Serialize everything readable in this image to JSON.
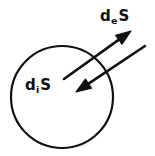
{
  "figure": {
    "background_color": "#ffffff",
    "stroke_color": "#111111",
    "labels": {
      "external": {
        "base": "d",
        "sub": "e",
        "symbol": "S",
        "full": "deS"
      },
      "internal": {
        "base": "d",
        "sub": "i",
        "symbol": "S",
        "full": "diS"
      }
    },
    "shapes": {
      "circle": {
        "cx": 62,
        "cy": 97,
        "r": 51,
        "stroke_width": 2.2,
        "fill": "none"
      },
      "arrow_outward": {
        "name": "external-entropy-flow-arrow",
        "x1": 64,
        "y1": 79,
        "x2": 131,
        "y2": 31,
        "direction": "up-right",
        "stroke_width": 2.6
      },
      "arrow_inward": {
        "name": "internal-entropy-flow-arrow",
        "x1": 145,
        "y1": 46,
        "x2": 76,
        "y2": 92,
        "direction": "down-left",
        "stroke_width": 2.6
      }
    }
  }
}
